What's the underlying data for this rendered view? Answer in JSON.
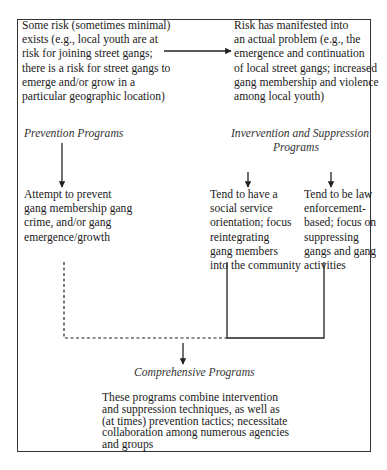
{
  "diagram": {
    "risk_box": {
      "lines": [
        "Some risk (sometimes minimal)",
        "exists (e.g., local youth are at",
        "risk for joining street gangs;",
        "there is a risk for street gangs to",
        "emerge and/or grow in a",
        "particular geographic location)"
      ]
    },
    "problem_box": {
      "lines": [
        "Risk has manifested into",
        "an actual problem (e.g., the",
        "emergence and continuation",
        "of local street gangs; increased",
        "gang membership and violence",
        "among local youth)"
      ]
    },
    "prevention": {
      "heading": "Prevention Programs",
      "lines": [
        "Attempt to prevent",
        "gang membership gang",
        "crime, and/or gang",
        "emergence/growth"
      ]
    },
    "intervention": {
      "heading_line1": "Invervention and Suppression",
      "heading_line2": "Programs",
      "social_service": {
        "lines": [
          "Tend to have a",
          "social service",
          "orientation; focus",
          "reintegrating",
          "gang members",
          "into the community"
        ]
      },
      "law_enforcement": {
        "lines": [
          "Tend to be law",
          "enforcement-",
          "based; focus on",
          "suppressing",
          "gangs and gang",
          "activities"
        ]
      }
    },
    "comprehensive": {
      "heading": "Comprehensive Programs",
      "lines": [
        "These programs combine intervention",
        "and suppression techniques, as well as",
        "(at times) prevention tactics; necessitate",
        "collaboration among numerous agencies",
        "and groups"
      ]
    },
    "colors": {
      "line": "#222222",
      "text": "#1a1a1a",
      "heading": "#333333"
    }
  }
}
